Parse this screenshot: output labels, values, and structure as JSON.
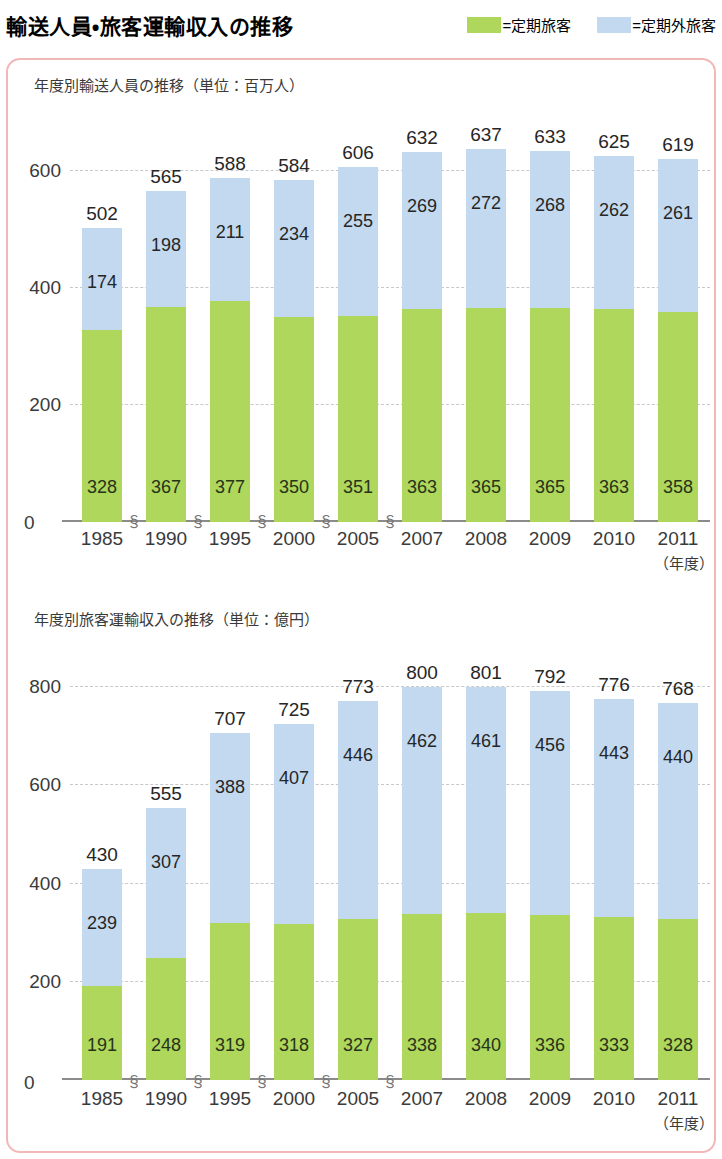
{
  "header": {
    "title": "輸送人員・旅客運輸収入の推移",
    "legend": [
      {
        "name": "commuter-pass",
        "swatch": "#aed75c",
        "label": "=定期旅客"
      },
      {
        "name": "non-commuter",
        "swatch": "#c2d9f0",
        "label": "=定期外旅客"
      }
    ]
  },
  "colors": {
    "green": "#aed75c",
    "blue": "#c2d9f0",
    "frame": "#f2b8b8",
    "axis": "#8b8b8b",
    "grid": "#c8c8c8"
  },
  "panels": [
    {
      "id": "passengers",
      "title": "年度別輸送人員の推移（単位：百万人）",
      "x_unit": "（年度）",
      "zero_label": "0"
    },
    {
      "id": "revenue",
      "title": "年度別旅客運輸収入の推移（単位：億円）",
      "x_unit": "（年度）",
      "zero_label": "0"
    }
  ],
  "chart_data": [
    {
      "type": "bar",
      "stacked": true,
      "title": "年度別輸送人員の推移（単位：百万人）",
      "xlabel": "（年度）",
      "ylabel": "百万人",
      "ylim": [
        0,
        700
      ],
      "yticks": [
        0,
        200,
        400,
        600
      ],
      "ytick_labels": [
        "0",
        "200",
        "400",
        "600"
      ],
      "grid": true,
      "legend_position": "top-right",
      "axis_breaks_after": [
        "1985",
        "1990",
        "1995",
        "2000",
        "2005"
      ],
      "categories": [
        "1985",
        "1990",
        "1995",
        "2000",
        "2005",
        "2007",
        "2008",
        "2009",
        "2010",
        "2011"
      ],
      "series": [
        {
          "name": "=定期旅客",
          "color": "#aed75c",
          "values": [
            328,
            367,
            377,
            350,
            351,
            363,
            365,
            365,
            363,
            358
          ]
        },
        {
          "name": "=定期外旅客",
          "color": "#c2d9f0",
          "values": [
            174,
            198,
            211,
            234,
            255,
            269,
            272,
            268,
            262,
            261
          ]
        }
      ],
      "totals": [
        502,
        565,
        588,
        584,
        606,
        632,
        637,
        633,
        625,
        619
      ]
    },
    {
      "type": "bar",
      "stacked": true,
      "title": "年度別旅客運輸収入の推移（単位：億円）",
      "xlabel": "（年度）",
      "ylabel": "億円",
      "ylim": [
        0,
        880
      ],
      "yticks": [
        0,
        200,
        400,
        600,
        800
      ],
      "ytick_labels": [
        "0",
        "200",
        "400",
        "600",
        "800"
      ],
      "grid": true,
      "legend_position": "top-right",
      "axis_breaks_after": [
        "1985",
        "1990",
        "1995",
        "2000",
        "2005"
      ],
      "categories": [
        "1985",
        "1990",
        "1995",
        "2000",
        "2005",
        "2007",
        "2008",
        "2009",
        "2010",
        "2011"
      ],
      "series": [
        {
          "name": "=定期旅客",
          "color": "#aed75c",
          "values": [
            191,
            248,
            319,
            318,
            327,
            338,
            340,
            336,
            333,
            328
          ]
        },
        {
          "name": "=定期外旅客",
          "color": "#c2d9f0",
          "values": [
            239,
            307,
            388,
            407,
            446,
            462,
            461,
            456,
            443,
            440
          ]
        }
      ],
      "totals": [
        430,
        555,
        707,
        725,
        773,
        800,
        801,
        792,
        776,
        768
      ]
    }
  ]
}
